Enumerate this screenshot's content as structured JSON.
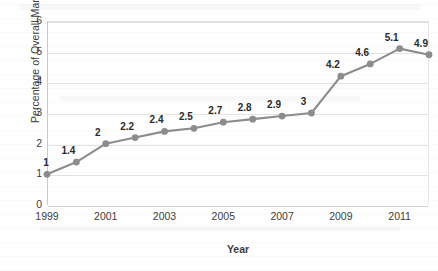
{
  "chart_data": {
    "type": "line",
    "title": "",
    "xlabel": "Year",
    "ylabel": "Percentage of Overall Market",
    "x": [
      1999,
      2000,
      2001,
      2002,
      2003,
      2004,
      2005,
      2006,
      2007,
      2008,
      2009,
      2010,
      2011,
      2012
    ],
    "values": [
      1,
      1.4,
      2,
      2.2,
      2.4,
      2.5,
      2.7,
      2.8,
      2.9,
      3,
      4.2,
      4.6,
      5.1,
      4.9
    ],
    "point_labels": [
      "1",
      "1.4",
      "2",
      "2.2",
      "2.4",
      "2.5",
      "2.7",
      "2.8",
      "2.9",
      "3",
      "4.2",
      "4.6",
      "5.1",
      "4.9"
    ],
    "xlim": [
      1999,
      2012
    ],
    "ylim": [
      0,
      6
    ],
    "ytick_labels": [
      "0",
      "1",
      "2",
      "3",
      "4",
      "5",
      "6"
    ],
    "yticks": [
      0,
      1,
      2,
      3,
      4,
      5,
      6
    ],
    "xtick_labels": [
      "1999",
      "2001",
      "2003",
      "2005",
      "2007",
      "2009",
      "2011"
    ],
    "xticks": [
      1999,
      2001,
      2003,
      2005,
      2007,
      2009,
      2011
    ],
    "grid": "horizontal",
    "legend": "none",
    "series_color": "#8c8c8c",
    "marker_color": "#8c8c8c",
    "gridline_color": "#e2e2e2",
    "text_color": "#3d3d3d",
    "background_color": "#ffffff"
  }
}
